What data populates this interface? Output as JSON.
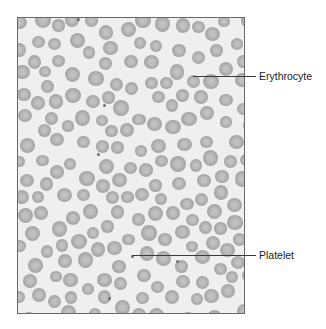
{
  "figure": {
    "labels": {
      "erythrocyte": "Erythrocyte",
      "platelet": "Platelet"
    },
    "colors": {
      "background": "#efefef",
      "cell": "#a9a9a9",
      "cell_center": "#c4c4c4",
      "platelet": "#6e6e6e",
      "frame": "#6a6a6a"
    },
    "leaders": {
      "erythrocyte": {
        "x1": 193,
        "y": 76,
        "x2": 256
      },
      "platelet": {
        "x1": 132,
        "y": 255,
        "x2": 256
      }
    },
    "platelets": [
      [
        131,
        255
      ],
      [
        176,
        260
      ],
      [
        97,
        153
      ],
      [
        103,
        104
      ],
      [
        245,
        155
      ],
      [
        77,
        18
      ],
      [
        108,
        297
      ]
    ]
  }
}
